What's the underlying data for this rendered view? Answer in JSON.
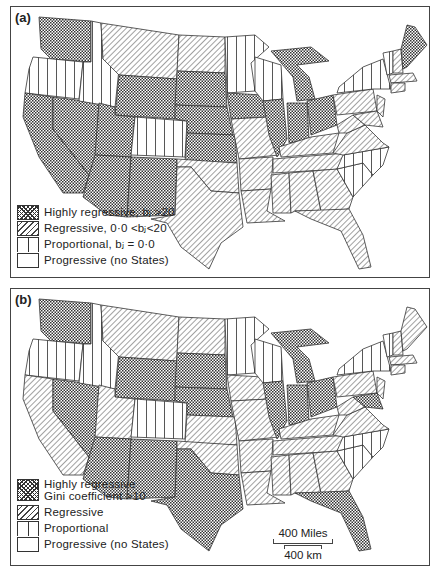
{
  "figure": {
    "panels": [
      {
        "label": "(a)",
        "legend": [
          {
            "pattern": "crosshatch",
            "text": "Highly regressive, bⱼ >20"
          },
          {
            "pattern": "diagonal",
            "text": "Regressive, 0·0 <bⱼ<20"
          },
          {
            "pattern": "vertical",
            "text": "Proportional, bⱼ = 0·0"
          },
          {
            "pattern": "blank",
            "text": "Progressive (no States)"
          }
        ],
        "states": {
          "highly_regressive": [
            "WA",
            "CA",
            "NV",
            "UT",
            "AZ",
            "NM",
            "WY",
            "SD",
            "NE",
            "KS",
            "IA",
            "IL",
            "IN",
            "MI",
            "OH",
            "ME"
          ],
          "regressive": [
            "MT",
            "ND",
            "TX",
            "OK",
            "MO",
            "AR",
            "LA",
            "MS",
            "AL",
            "GA",
            "FL",
            "TN",
            "KY",
            "WV",
            "PA",
            "NJ",
            "MD",
            "DE",
            "CT",
            "RI",
            "MA",
            "NH",
            "VA"
          ],
          "proportional": [
            "OR",
            "ID",
            "CO",
            "MN",
            "WI",
            "NY",
            "VT",
            "NC",
            "SC"
          ]
        }
      },
      {
        "label": "(b)",
        "legend": [
          {
            "pattern": "crosshatch",
            "text": "Highly regressive",
            "text2": "Gini coefficient >10"
          },
          {
            "pattern": "diagonal",
            "text": "Regressive"
          },
          {
            "pattern": "vertical",
            "text": "Proportional"
          },
          {
            "pattern": "blank",
            "text": "Progressive (no States)"
          }
        ],
        "states": {
          "highly_regressive": [
            "WA",
            "NV",
            "AZ",
            "NM",
            "TX",
            "WY",
            "SD",
            "NE",
            "IL",
            "IN",
            "MI",
            "OH",
            "FL",
            "MD"
          ],
          "regressive": [
            "CA",
            "UT",
            "MT",
            "ND",
            "KS",
            "IA",
            "OK",
            "MO",
            "AR",
            "LA",
            "MS",
            "AL",
            "GA",
            "TN",
            "KY",
            "WV",
            "PA",
            "NJ",
            "DE",
            "CT",
            "RI",
            "MA",
            "NH",
            "ME",
            "VA"
          ],
          "proportional": [
            "OR",
            "ID",
            "CO",
            "MN",
            "WI",
            "NY",
            "VT",
            "NC",
            "SC"
          ]
        },
        "scale": {
          "miles": "400 Miles",
          "km": "400 km"
        }
      }
    ]
  }
}
